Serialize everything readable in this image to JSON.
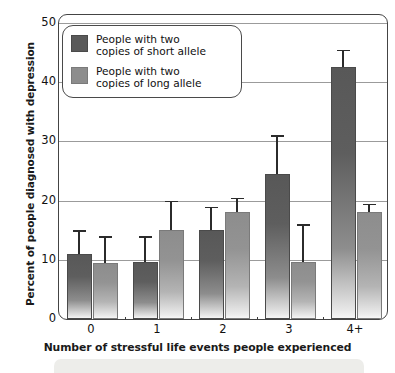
{
  "chart_data": {
    "type": "bar",
    "title": "",
    "subtitle": "",
    "xlabel": "Number of stressful life events people experienced",
    "ylabel": "Percent of people diagnosed with depression",
    "categories": [
      "0",
      "1",
      "2",
      "3",
      "4+"
    ],
    "ylim": [
      0,
      50
    ],
    "yticks": [
      0,
      10,
      20,
      30,
      40,
      50
    ],
    "yticks_minor": [
      5,
      15,
      25,
      35,
      45
    ],
    "grid": true,
    "legend_position": "top-left",
    "series": [
      {
        "name": "People with two copies of short allele",
        "name_line1": "People with two",
        "name_line2": "copies of short allele",
        "color": "#5a5a5a",
        "values": [
          11,
          9.7,
          15,
          24.5,
          42.5
        ],
        "error_upper": [
          15,
          14,
          19,
          31,
          45.5
        ]
      },
      {
        "name": "People with two copies of long allele",
        "name_line1": "People with two",
        "name_line2": "copies of long allele",
        "color": "#8d8d8d",
        "values": [
          9.5,
          15,
          18,
          9.7,
          18
        ],
        "error_upper": [
          14,
          20,
          20.5,
          16,
          19.5
        ]
      }
    ]
  },
  "axis": {
    "y_tick_labels": [
      "0",
      "10",
      "20",
      "30",
      "40",
      "50"
    ],
    "x_tick_labels": [
      "0",
      "1",
      "2",
      "3",
      "4+"
    ]
  },
  "legend": {
    "items": [
      {
        "line1": "People with two",
        "line2": "copies of short allele",
        "swatch": "short"
      },
      {
        "line1": "People with two",
        "line2": "copies of long allele",
        "swatch": "long"
      }
    ]
  }
}
